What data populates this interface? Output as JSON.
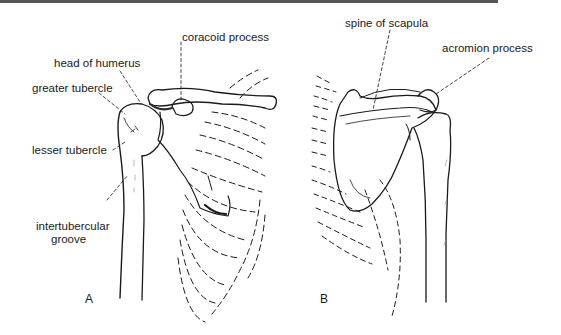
{
  "figure": {
    "panels": [
      {
        "letter": "A",
        "view": "anterior",
        "labels": {
          "coracoid_process": "coracoid process",
          "head_of_humerus": "head of humerus",
          "greater_tubercle": "greater tubercle",
          "lesser_tubercle": "lesser tubercle",
          "intertubercular_groove_1": "intertubercular",
          "intertubercular_groove_2": "groove"
        }
      },
      {
        "letter": "B",
        "view": "posterior",
        "labels": {
          "spine_of_scapula": "spine of scapula",
          "acromion_process": "acromion process"
        }
      }
    ],
    "colors": {
      "ink": "#1a1a1a",
      "rule": "#555555",
      "background": "#ffffff"
    }
  }
}
